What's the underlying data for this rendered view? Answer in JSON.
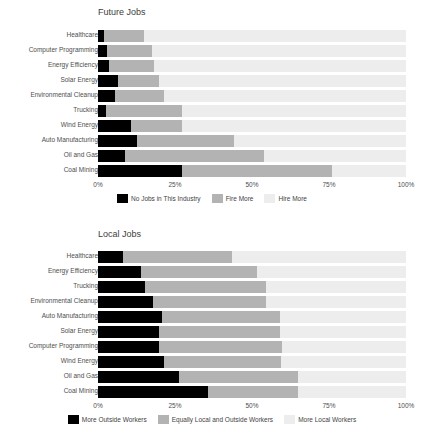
{
  "colors": {
    "series_1": "#000000",
    "series_2": "#b3b3b3",
    "series_3": "#ededed",
    "plot_background": "#ededed",
    "text": "#4a4a4a",
    "page_background": "#ffffff"
  },
  "charts": [
    {
      "id": "future-jobs",
      "title": "Future Jobs",
      "ticks": [
        "0%",
        "25%",
        "50%",
        "75%",
        "100%"
      ],
      "legend": [
        {
          "label": "No Jobs in This Industry",
          "color": "#000000"
        },
        {
          "label": "Fire More",
          "color": "#b3b3b3"
        },
        {
          "label": "Hire More",
          "color": "#ededed"
        }
      ],
      "rows": [
        {
          "label": "Healthcare",
          "a": 2,
          "b": 13,
          "c": 85
        },
        {
          "label": "Computer Programming",
          "a": 3,
          "b": 14.5,
          "c": 82.5
        },
        {
          "label": "Energy Efficiency",
          "a": 3.5,
          "b": 14.8,
          "c": 81.7
        },
        {
          "label": "Solar Energy",
          "a": 6.6,
          "b": 13.3,
          "c": 80.1
        },
        {
          "label": "Environmental Cleanup",
          "a": 5.5,
          "b": 16,
          "c": 78.5
        },
        {
          "label": "Trucking",
          "a": 2.6,
          "b": 24.6,
          "c": 72.8
        },
        {
          "label": "Wind Energy",
          "a": 10.7,
          "b": 16.6,
          "c": 72.7
        },
        {
          "label": "Auto Manufacturing",
          "a": 12.6,
          "b": 31.7,
          "c": 55.7
        },
        {
          "label": "Oil and Gas",
          "a": 8.9,
          "b": 45.1,
          "c": 46.0
        },
        {
          "label": "Coal Mining",
          "a": 27.2,
          "b": 48.8,
          "c": 24.0
        }
      ]
    },
    {
      "id": "local-jobs",
      "title": "Local Jobs",
      "ticks": [
        "0%",
        "25%",
        "50%",
        "75%",
        "100%"
      ],
      "legend": [
        {
          "label": "More Outside Workers",
          "color": "#000000"
        },
        {
          "label": "Equally Local and Outside Workers",
          "color": "#b3b3b3"
        },
        {
          "label": "More Local Workers",
          "color": "#ededed"
        }
      ],
      "rows": [
        {
          "label": "Healthcare",
          "a": 8.0,
          "b": 35.5,
          "c": 56.5
        },
        {
          "label": "Energy Efficiency",
          "a": 14.0,
          "b": 37.7,
          "c": 48.3
        },
        {
          "label": "Trucking",
          "a": 15.4,
          "b": 39.1,
          "c": 45.5
        },
        {
          "label": "Environmental Cleanup",
          "a": 17.7,
          "b": 37.0,
          "c": 45.3
        },
        {
          "label": "Auto Manufacturing",
          "a": 20.7,
          "b": 38.3,
          "c": 41.0
        },
        {
          "label": "Solar Energy",
          "a": 19.9,
          "b": 39.1,
          "c": 41.0
        },
        {
          "label": "Computer Programming",
          "a": 19.7,
          "b": 39.9,
          "c": 40.4
        },
        {
          "label": "Wind Energy",
          "a": 21.3,
          "b": 38.0,
          "c": 40.7
        },
        {
          "label": "Oil and Gas",
          "a": 26.4,
          "b": 38.6,
          "c": 35.0
        },
        {
          "label": "Coal Mining",
          "a": 35.8,
          "b": 29.1,
          "c": 35.1
        }
      ]
    }
  ],
  "chart_data": [
    {
      "type": "bar",
      "orientation": "horizontal",
      "stacked": true,
      "normalized": true,
      "title": "Future Jobs",
      "xlabel": "",
      "ylabel": "",
      "xlim": [
        0,
        100
      ],
      "xticks": [
        0,
        25,
        50,
        75,
        100
      ],
      "xticklabels": [
        "0%",
        "25%",
        "50%",
        "75%",
        "100%"
      ],
      "grid": false,
      "legend_position": "bottom-center",
      "categories": [
        "Healthcare",
        "Computer Programming",
        "Energy Efficiency",
        "Solar Energy",
        "Environmental Cleanup",
        "Trucking",
        "Wind Energy",
        "Auto Manufacturing",
        "Oil and Gas",
        "Coal Mining"
      ],
      "series": [
        {
          "name": "No Jobs in This Industry",
          "color": "#000000",
          "values": [
            2,
            3,
            3.5,
            6.6,
            5.5,
            2.6,
            10.7,
            12.6,
            8.9,
            27.2
          ]
        },
        {
          "name": "Fire More",
          "color": "#b3b3b3",
          "values": [
            13,
            14.5,
            14.8,
            13.3,
            16,
            24.6,
            16.6,
            31.7,
            45.1,
            48.8
          ]
        },
        {
          "name": "Hire More",
          "color": "#ededed",
          "values": [
            85,
            82.5,
            81.7,
            80.1,
            78.5,
            72.8,
            72.7,
            55.7,
            46.0,
            24.0
          ]
        }
      ]
    },
    {
      "type": "bar",
      "orientation": "horizontal",
      "stacked": true,
      "normalized": true,
      "title": "Local Jobs",
      "xlabel": "",
      "ylabel": "",
      "xlim": [
        0,
        100
      ],
      "xticks": [
        0,
        25,
        50,
        75,
        100
      ],
      "xticklabels": [
        "0%",
        "25%",
        "50%",
        "75%",
        "100%"
      ],
      "grid": false,
      "legend_position": "bottom-center",
      "categories": [
        "Healthcare",
        "Energy Efficiency",
        "Trucking",
        "Environmental Cleanup",
        "Auto Manufacturing",
        "Solar Energy",
        "Computer Programming",
        "Wind Energy",
        "Oil and Gas",
        "Coal Mining"
      ],
      "series": [
        {
          "name": "More Outside Workers",
          "color": "#000000",
          "values": [
            8.0,
            14.0,
            15.4,
            17.7,
            20.7,
            19.9,
            19.7,
            21.3,
            26.4,
            35.8
          ]
        },
        {
          "name": "Equally Local and Outside Workers",
          "color": "#b3b3b3",
          "values": [
            35.5,
            37.7,
            39.1,
            37.0,
            38.3,
            39.1,
            39.9,
            38.0,
            38.6,
            29.1
          ]
        },
        {
          "name": "More Local Workers",
          "color": "#ededed",
          "values": [
            56.5,
            48.3,
            45.3,
            45.3,
            41.0,
            41.0,
            40.4,
            40.7,
            35.0,
            35.1
          ]
        }
      ]
    }
  ]
}
